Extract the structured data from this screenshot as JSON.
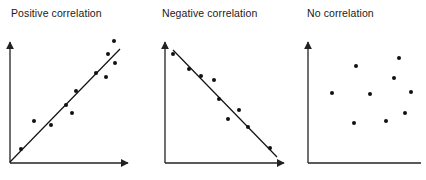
{
  "chart_data": [
    {
      "type": "scatter",
      "title": "Positive correlation",
      "xlabel": "",
      "ylabel": "",
      "grid": false,
      "trendline": true,
      "axis_pixels": {
        "origin": [
          10,
          163
        ],
        "x_end": [
          128,
          163
        ],
        "y_end": [
          10,
          42
        ]
      },
      "trend_pixels": [
        [
          10,
          162
        ],
        [
          120,
          49
        ]
      ],
      "points_pixels": [
        [
          21,
          149
        ],
        [
          34,
          121
        ],
        [
          51,
          125
        ],
        [
          66,
          105
        ],
        [
          72,
          113
        ],
        [
          76,
          91
        ],
        [
          96,
          73
        ],
        [
          106,
          77
        ],
        [
          108,
          54
        ],
        [
          115,
          63
        ],
        [
          114,
          41
        ]
      ]
    },
    {
      "type": "scatter",
      "title": "Negative correlation",
      "xlabel": "",
      "ylabel": "",
      "grid": false,
      "trendline": true,
      "axis_pixels": {
        "origin": [
          165,
          163
        ],
        "x_end": [
          284,
          163
        ],
        "y_end": [
          165,
          42
        ]
      },
      "trend_pixels": [
        [
          173,
          50
        ],
        [
          277,
          157
        ]
      ],
      "points_pixels": [
        [
          173,
          54
        ],
        [
          189,
          69
        ],
        [
          201,
          76
        ],
        [
          214,
          80
        ],
        [
          219,
          99
        ],
        [
          228,
          119
        ],
        [
          239,
          110
        ],
        [
          248,
          127
        ],
        [
          270,
          148
        ]
      ]
    },
    {
      "type": "scatter",
      "title": "No correlation",
      "xlabel": "",
      "ylabel": "",
      "grid": false,
      "trendline": false,
      "axis_pixels": {
        "origin": [
          308,
          163
        ],
        "x_end": [
          421,
          163
        ],
        "y_end": [
          308,
          42
        ]
      },
      "points_pixels": [
        [
          332,
          93
        ],
        [
          356,
          66
        ],
        [
          370,
          94
        ],
        [
          354,
          123
        ],
        [
          386,
          121
        ],
        [
          394,
          78
        ],
        [
          399,
          58
        ],
        [
          411,
          92
        ],
        [
          405,
          113
        ]
      ]
    }
  ],
  "titles": {
    "positive": "Positive correlation",
    "negative": "Negative correlation",
    "none": "No correlation"
  },
  "colors": {
    "ink": "#111111",
    "axis": "#222222"
  }
}
